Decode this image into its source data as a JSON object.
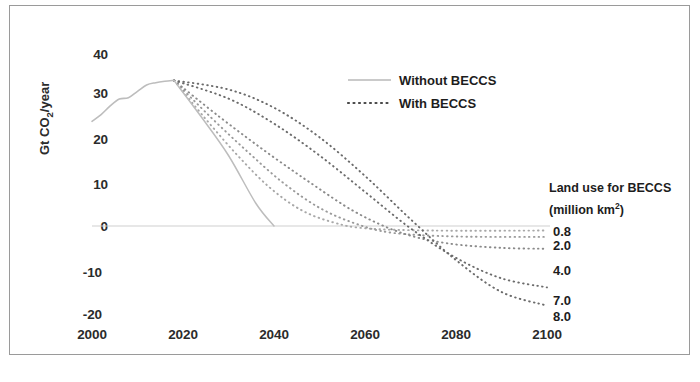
{
  "chart_data": {
    "type": "line",
    "title": "",
    "xlabel": "",
    "ylabel": "Gt CO2/year",
    "ylabel_display": "Gt CO",
    "ylabel_sub": "2",
    "ylabel_tail": "/year",
    "xlim": [
      2000,
      2100
    ],
    "ylim": [
      -20,
      40
    ],
    "xticks": [
      2000,
      2020,
      2040,
      2060,
      2080,
      2100
    ],
    "yticks": [
      40,
      30,
      20,
      10,
      0,
      -10,
      -20
    ],
    "grid": false,
    "legend_position": "top-center-right",
    "legend": [
      {
        "label": "Without BECCS",
        "style": "solid",
        "color": "#b8b8b8"
      },
      {
        "label": "With BECCS",
        "style": "dotted",
        "color": "#4a4a4a"
      }
    ],
    "annotations": {
      "side_title_line1": "Land use for BECCS",
      "side_title_line2": "(million km",
      "side_title_sup": "2",
      "side_title_line2_end": ")"
    },
    "historical": {
      "name": "Historical emissions",
      "x": [
        2000,
        2002,
        2004,
        2006,
        2008,
        2010,
        2012,
        2014,
        2016,
        2018
      ],
      "y": [
        23.0,
        24.5,
        26.4,
        27.9,
        28.2,
        29.6,
        31.0,
        31.5,
        31.8,
        32.0
      ]
    },
    "series": [
      {
        "name": "Without BECCS",
        "land_use": "",
        "style": "solid",
        "color": "#bdbdbd",
        "x": [
          2018,
          2024,
          2030,
          2036,
          2040
        ],
        "y": [
          32.0,
          24.0,
          15.5,
          5.0,
          0.0
        ]
      },
      {
        "name": "With BECCS 8.0",
        "land_use": "8.0",
        "style": "dotted",
        "color": "#6b6b6b",
        "x": [
          2018,
          2030,
          2040,
          2050,
          2060,
          2070,
          2080,
          2090,
          2100
        ],
        "y": [
          32.0,
          30.0,
          26.0,
          19.5,
          11.0,
          1.5,
          -7.5,
          -14.5,
          -17.5
        ]
      },
      {
        "name": "With BECCS 7.0",
        "land_use": "7.0",
        "style": "dotted",
        "color": "#6b6b6b",
        "x": [
          2018,
          2030,
          2040,
          2050,
          2060,
          2070,
          2080,
          2090,
          2100
        ],
        "y": [
          32.0,
          28.0,
          22.5,
          15.5,
          7.5,
          -0.5,
          -7.0,
          -11.5,
          -13.5
        ]
      },
      {
        "name": "With BECCS 4.0",
        "land_use": "4.0",
        "style": "dotted",
        "color": "#8a8a8a",
        "x": [
          2018,
          2028,
          2038,
          2048,
          2058,
          2068,
          2078,
          2090,
          2100
        ],
        "y": [
          32.0,
          24.0,
          16.5,
          9.5,
          3.0,
          -1.5,
          -3.8,
          -4.8,
          -5.0
        ]
      },
      {
        "name": "With BECCS 2.0",
        "land_use": "2.0",
        "style": "dotted",
        "color": "#9a9a9a",
        "x": [
          2018,
          2026,
          2034,
          2042,
          2050,
          2058,
          2066,
          2080,
          2100
        ],
        "y": [
          32.0,
          24.0,
          16.5,
          9.5,
          4.0,
          0.5,
          -1.5,
          -2.3,
          -2.4
        ]
      },
      {
        "name": "With BECCS 0.8",
        "land_use": "0.8",
        "style": "dotted",
        "color": "#a8a8a8",
        "x": [
          2018,
          2025,
          2032,
          2039,
          2046,
          2053,
          2060,
          2075,
          2100
        ],
        "y": [
          32.0,
          23.5,
          15.5,
          8.5,
          3.5,
          0.8,
          -0.5,
          -1.0,
          -1.0
        ]
      }
    ],
    "series_labels": [
      "0.8",
      "2.0",
      "4.0",
      "7.0",
      "8.0"
    ]
  }
}
